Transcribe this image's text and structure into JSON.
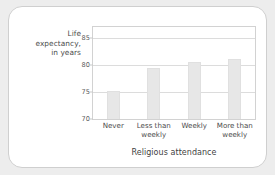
{
  "chart_data": {
    "type": "bar",
    "title": "",
    "xlabel": "Religious attendance",
    "ylabel": "Life expectancy, in years",
    "ylabel_lines": [
      "Life",
      "expectancy,",
      "in years"
    ],
    "categories": [
      "Never",
      "Less than weekly",
      "Weekly",
      "More than weekly"
    ],
    "category_lines": [
      [
        "Never"
      ],
      [
        "Less than",
        "weekly"
      ],
      [
        "Weekly"
      ],
      [
        "More than",
        "weekly"
      ]
    ],
    "values": [
      75.1,
      79.5,
      80.5,
      81.1
    ],
    "ylim": [
      70,
      87
    ],
    "yticks": [
      85,
      80,
      75,
      70
    ],
    "ytick_labels": [
      "85",
      "80",
      "75",
      "70"
    ],
    "grid": true,
    "legend": "none",
    "bar_color": "#e7e7e7",
    "bar_border_color": "#e0e0e0",
    "grid_color": "#dcdcdc",
    "frame_color": "#d2d2d2",
    "text_color": "#4c4c4c",
    "card_background": "#ffffff",
    "page_background": "#ededed"
  }
}
